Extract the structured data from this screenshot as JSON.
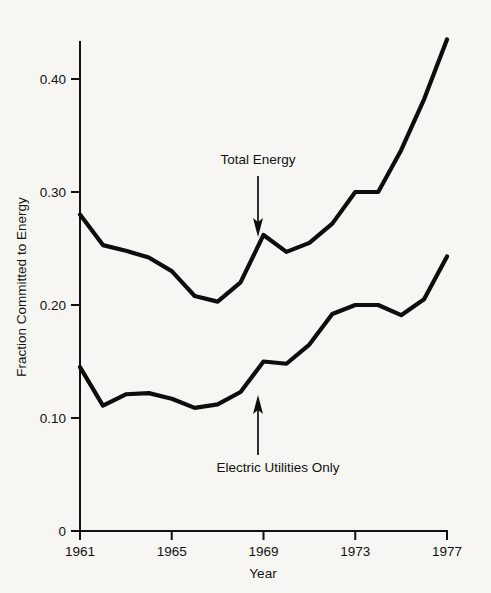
{
  "chart_data": {
    "type": "line",
    "title": "",
    "xlabel": "Year",
    "ylabel": "Fraction Committed to Energy",
    "xlim": [
      1961,
      1977
    ],
    "ylim": [
      0,
      0.44
    ],
    "grid": false,
    "legend_position": "inline-annotations",
    "x": [
      1961,
      1962,
      1963,
      1964,
      1965,
      1966,
      1967,
      1968,
      1969,
      1970,
      1971,
      1972,
      1973,
      1974,
      1975,
      1976,
      1977
    ],
    "series": [
      {
        "name": "Total Energy",
        "values": [
          0.28,
          0.253,
          0.248,
          0.242,
          0.23,
          0.208,
          0.203,
          0.22,
          0.262,
          0.247,
          0.255,
          0.272,
          0.3,
          0.3,
          0.337,
          0.382,
          0.435
        ]
      },
      {
        "name": "Electric Utilities Only",
        "values": [
          0.145,
          0.111,
          0.121,
          0.122,
          0.117,
          0.109,
          0.112,
          0.123,
          0.15,
          0.148,
          0.165,
          0.192,
          0.2,
          0.2,
          0.191,
          0.205,
          0.243
        ]
      }
    ],
    "y_ticks": [
      "0",
      "0.10",
      "0.20",
      "0.30",
      "0.40"
    ],
    "y_tick_values": [
      0,
      0.1,
      0.2,
      0.3,
      0.4
    ],
    "x_ticks": [
      "1961",
      "1965",
      "1969",
      "1973",
      "1977"
    ],
    "x_tick_values": [
      1961,
      1965,
      1969,
      1973,
      1977
    ],
    "annotations": [
      {
        "text": "Total Energy",
        "arrow_direction": "down",
        "points_at_series": "Total Energy",
        "points_at_x": 1969
      },
      {
        "text": "Electric Utilities Only",
        "arrow_direction": "up",
        "points_at_series": "Electric Utilities Only",
        "points_at_x": 1969
      }
    ],
    "colors": {
      "line": "#0d0d0d",
      "axis": "#111111",
      "background": "#f7f6f3"
    }
  }
}
